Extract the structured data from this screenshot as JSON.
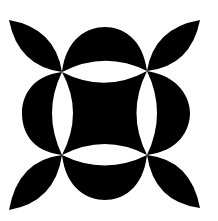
{
  "figure": {
    "description": "Black-and-white geometric quilt-block motif: four corner leaf petals, four outer half-disc lobes, and a central concave square framed by white lens shapes",
    "colors": {
      "ink": "#000000",
      "background": "#ffffff"
    },
    "nodes": [
      [
        62,
        72
      ],
      [
        147,
        71
      ],
      [
        62,
        155
      ],
      [
        147,
        155
      ]
    ]
  }
}
